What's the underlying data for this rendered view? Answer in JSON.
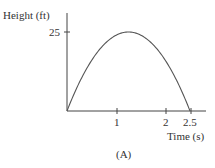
{
  "chart_data": {
    "type": "line",
    "title": "",
    "caption": "(A)",
    "xlabel": "Time (s)",
    "ylabel": "Height (ft)",
    "x_ticks": [
      1,
      2,
      2.5
    ],
    "x_tick_labels": [
      "1",
      "2",
      "2.5"
    ],
    "y_ticks": [
      25
    ],
    "y_tick_labels": [
      "25"
    ],
    "xlim": [
      0,
      2.75
    ],
    "ylim": [
      0,
      28
    ],
    "grid": false,
    "legend": null,
    "series": [
      {
        "name": "height",
        "equation": "h = 25 - 16(t - 1.25)^2",
        "x": [
          0,
          0.25,
          0.5,
          0.75,
          1.0,
          1.25,
          1.5,
          1.75,
          2.0,
          2.25,
          2.5
        ],
        "y": [
          0,
          9,
          16,
          21,
          24,
          25,
          24,
          21,
          16,
          9,
          0
        ]
      }
    ]
  },
  "labels": {
    "ylabel": "Height (ft)",
    "xlabel": "Time (s)",
    "ytick_25": "25",
    "xtick_1": "1",
    "xtick_2": "2",
    "xtick_2_5": "2.5",
    "caption": "(A)"
  }
}
